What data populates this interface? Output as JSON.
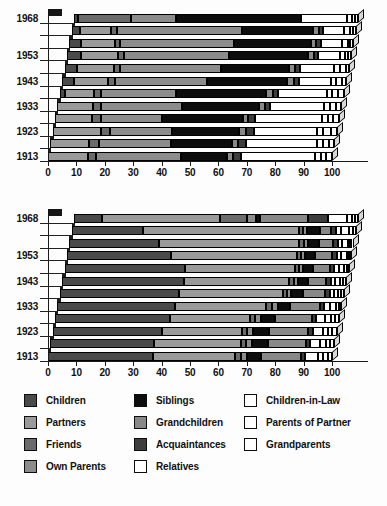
{
  "figure": {
    "kind": "two-panel 3D stacked horizontal bar chart",
    "axis_min": 0,
    "axis_max": 100
  },
  "palette": {
    "children": "#4a4a4a",
    "partners": "#9a9a9a",
    "friends": "#6b6b6b",
    "own_parents": "#8c8c8c",
    "siblings": "#0d0d0d",
    "grandchildren": "#888888",
    "acquaintances": "#3d3d3d",
    "relatives": "#ffffff",
    "children_in_law": "#ffffff",
    "parents_of_partner": "#ffffff",
    "grandparents": "#ffffff",
    "outline": "#000000"
  },
  "legend": {
    "columns": [
      {
        "items": [
          {
            "label": "Children",
            "key": "children",
            "color": "#4a4a4a"
          },
          {
            "label": "Partners",
            "key": "partners",
            "color": "#9a9a9a"
          },
          {
            "label": "Friends",
            "key": "friends",
            "color": "#6b6b6b"
          },
          {
            "label": "Own Parents",
            "key": "own_parents",
            "color": "#8c8c8c"
          }
        ]
      },
      {
        "items": [
          {
            "label": "Siblings",
            "key": "siblings",
            "color": "#0d0d0d"
          },
          {
            "label": "Grandchildren",
            "key": "grandchildren",
            "color": "#888888"
          },
          {
            "label": "Acquaintances",
            "key": "acquaintances",
            "color": "#3d3d3d"
          },
          {
            "label": "Relatives",
            "key": "relatives",
            "color": "#ffffff"
          }
        ]
      },
      {
        "items": [
          {
            "label": "Children-in-Law",
            "key": "children_in_law",
            "color": "#ffffff"
          },
          {
            "label": "Parents of Partner",
            "key": "parents_of_partner",
            "color": "#ffffff"
          },
          {
            "label": "Grandparents",
            "key": "grandparents",
            "color": "#ffffff"
          }
        ]
      }
    ]
  },
  "chart_data": [
    {
      "id": "chart-top",
      "type": "bar",
      "orientation": "horizontal",
      "stacked": true,
      "normalized": true,
      "title": "",
      "xlabel": "",
      "ylabel": "",
      "xlim": [
        0,
        100
      ],
      "xticks": [
        0,
        10,
        20,
        30,
        40,
        50,
        60,
        70,
        80,
        90,
        100
      ],
      "xticklabels": [
        "0",
        "10",
        "20",
        "30",
        "40",
        "50",
        "60",
        "70",
        "80",
        "90",
        "100"
      ],
      "grid": false,
      "legend_position": "below figure",
      "categories": [
        "1913",
        "1918",
        "1923",
        "1928",
        "1933",
        "1938",
        "1943",
        "1948",
        "1953",
        "1958",
        "1963",
        "1968"
      ],
      "ytick_labels_shown": [
        "1913",
        "1923",
        "1933",
        "1943",
        "1953",
        "1968"
      ],
      "series": [
        {
          "name": "Children",
          "values": [
            0.0,
            0.0,
            0.0,
            0.0,
            0.0,
            2.0,
            4.0,
            4.5,
            5.0,
            4.0,
            3.0,
            1.5
          ]
        },
        {
          "name": "Partners",
          "values": [
            14.0,
            13.5,
            17.0,
            13.0,
            12.5,
            10.0,
            12.0,
            13.0,
            13.0,
            12.0,
            11.0,
            0.0
          ]
        },
        {
          "name": "Friends",
          "values": [
            3.0,
            3.5,
            3.0,
            3.0,
            3.0,
            2.5,
            2.5,
            2.0,
            2.0,
            2.0,
            2.0,
            18.5
          ]
        },
        {
          "name": "Own Parents",
          "values": [
            30.0,
            25.5,
            22.0,
            21.5,
            28.5,
            26.5,
            32.5,
            35.5,
            37.0,
            40.0,
            44.0,
            16.0
          ]
        },
        {
          "name": "Siblings",
          "values": [
            16.0,
            21.5,
            23.5,
            28.5,
            27.0,
            31.5,
            28.0,
            24.0,
            28.0,
            27.0,
            25.0,
            44.0
          ]
        },
        {
          "name": "Grandchildren",
          "values": [
            2.0,
            2.0,
            2.5,
            2.0,
            2.0,
            2.5,
            2.5,
            2.0,
            2.0,
            2.0,
            2.0,
            0.0
          ]
        },
        {
          "name": "Acquaintances",
          "values": [
            3.0,
            3.0,
            3.0,
            2.5,
            2.0,
            2.0,
            2.0,
            2.0,
            1.5,
            1.5,
            1.5,
            0.0
          ]
        },
        {
          "name": "Relatives",
          "values": [
            26.0,
            25.0,
            22.0,
            23.5,
            19.0,
            17.0,
            11.0,
            12.0,
            7.5,
            7.5,
            7.5,
            16.0
          ]
        },
        {
          "name": "Children-in-Law",
          "values": [
            2.0,
            2.0,
            2.0,
            2.0,
            2.0,
            2.0,
            2.0,
            2.0,
            2.0,
            2.0,
            2.0,
            2.0
          ]
        },
        {
          "name": "Parents of Partner",
          "values": [
            2.0,
            2.0,
            3.0,
            2.0,
            2.0,
            2.0,
            2.0,
            2.0,
            1.0,
            1.0,
            1.0,
            1.0
          ]
        },
        {
          "name": "Grandparents",
          "values": [
            2.0,
            2.0,
            2.0,
            2.0,
            2.0,
            2.0,
            1.5,
            1.0,
            1.0,
            1.0,
            1.0,
            1.0
          ]
        }
      ]
    },
    {
      "id": "chart-bottom",
      "type": "bar",
      "orientation": "horizontal",
      "stacked": true,
      "normalized": true,
      "title": "",
      "xlabel": "",
      "ylabel": "",
      "xlim": [
        0,
        100
      ],
      "xticks": [
        0,
        10,
        20,
        30,
        40,
        50,
        60,
        70,
        80,
        90,
        100
      ],
      "xticklabels": [
        "0",
        "10",
        "20",
        "30",
        "40",
        "50",
        "60",
        "70",
        "80",
        "90",
        "100"
      ],
      "grid": false,
      "legend_position": "below figure",
      "categories": [
        "1913",
        "1918",
        "1923",
        "1928",
        "1933",
        "1938",
        "1943",
        "1948",
        "1953",
        "1958",
        "1963",
        "1968"
      ],
      "ytick_labels_shown": [
        "1913",
        "1923",
        "1933",
        "1943",
        "1953",
        "1968"
      ],
      "series": [
        {
          "name": "Children",
          "values": [
            37.0,
            36.5,
            38.5,
            40.5,
            41.5,
            42.0,
            43.0,
            42.5,
            36.5,
            31.5,
            25.0,
            10.0
          ]
        },
        {
          "name": "Partners",
          "values": [
            29.0,
            30.5,
            28.0,
            28.0,
            32.0,
            36.5,
            37.0,
            38.5,
            44.5,
            49.5,
            55.0,
            41.5
          ]
        },
        {
          "name": "Friends",
          "values": [
            2.0,
            2.0,
            2.0,
            2.0,
            2.0,
            1.5,
            1.5,
            1.5,
            1.5,
            1.5,
            1.5,
            9.5
          ]
        },
        {
          "name": "Own Parents",
          "values": [
            2.0,
            2.0,
            2.0,
            2.0,
            2.0,
            1.5,
            1.5,
            1.5,
            1.5,
            1.5,
            1.5,
            3.0
          ]
        },
        {
          "name": "Siblings",
          "values": [
            5.0,
            5.5,
            5.5,
            5.0,
            4.5,
            4.0,
            3.5,
            3.5,
            3.5,
            4.0,
            4.5,
            1.5
          ]
        },
        {
          "name": "Grandchildren",
          "values": [
            14.0,
            13.5,
            14.0,
            13.0,
            10.5,
            8.0,
            6.5,
            6.0,
            6.0,
            5.0,
            4.0,
            17.0
          ]
        },
        {
          "name": "Acquaintances",
          "values": [
            1.5,
            1.5,
            1.5,
            1.5,
            1.5,
            1.5,
            1.5,
            1.5,
            1.5,
            1.5,
            1.5,
            7.0
          ]
        },
        {
          "name": "Relatives",
          "values": [
            4.5,
            3.5,
            3.5,
            3.0,
            2.0,
            1.5,
            1.5,
            1.5,
            1.5,
            1.5,
            2.0,
            6.5
          ]
        },
        {
          "name": "Children-in-Law",
          "values": [
            2.0,
            2.0,
            2.0,
            2.0,
            2.0,
            1.5,
            2.0,
            2.0,
            2.0,
            2.0,
            2.5,
            2.0
          ]
        },
        {
          "name": "Parents of Partner",
          "values": [
            1.5,
            1.5,
            1.5,
            1.5,
            1.0,
            1.0,
            1.0,
            1.0,
            1.0,
            1.0,
            1.5,
            1.0
          ]
        },
        {
          "name": "Grandparents",
          "values": [
            1.5,
            1.5,
            1.5,
            1.5,
            1.0,
            1.0,
            1.0,
            0.5,
            0.5,
            0.5,
            1.0,
            1.0
          ]
        }
      ]
    }
  ]
}
